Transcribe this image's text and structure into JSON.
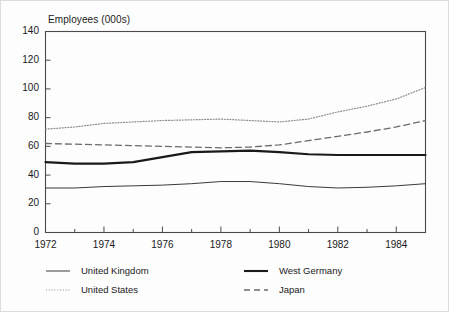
{
  "figure": {
    "title": "Employees (000s)",
    "background_color": "#fdfdfd",
    "border_color": "#dcdcdc"
  },
  "axes": {
    "y_label": "Employees (000s)",
    "y_ticks": [
      "0",
      "20",
      "40",
      "60",
      "80",
      "100",
      "120",
      "140"
    ],
    "x_ticks": [
      "1972",
      "1974",
      "1976",
      "1978",
      "1980",
      "1982",
      "1984"
    ],
    "x_minor_every_year": true
  },
  "legend": {
    "position": "below-plot",
    "entries": [
      {
        "label": "United Kingdom",
        "style": "thin-solid",
        "color": "#3a3a3a"
      },
      {
        "label": "West Germany",
        "style": "thick-solid",
        "color": "#1a1a1a"
      },
      {
        "label": "United States",
        "style": "dotted",
        "color": "#8a8a8a"
      },
      {
        "label": "Japan",
        "style": "dashed",
        "color": "#6a6a6a"
      }
    ]
  },
  "chart_data": {
    "type": "line",
    "title": "Employees (000s)",
    "xlabel": "",
    "ylabel": "Employees (000s)",
    "xlim": [
      1972,
      1985
    ],
    "ylim": [
      0,
      140
    ],
    "grid": false,
    "legend_position": "below",
    "x": [
      1972,
      1973,
      1974,
      1975,
      1976,
      1977,
      1978,
      1979,
      1980,
      1981,
      1982,
      1983,
      1984,
      1985
    ],
    "series": [
      {
        "name": "United Kingdom",
        "style": "thin-solid",
        "color": "#3a3a3a",
        "values": [
          31,
          31,
          32,
          32.5,
          33,
          34,
          35.5,
          35.5,
          34,
          32,
          31,
          31.5,
          32.5,
          34
        ]
      },
      {
        "name": "United States",
        "style": "dotted",
        "color": "#8a8a8a",
        "values": [
          72,
          73.5,
          76,
          77,
          78,
          78.5,
          79,
          78,
          77,
          79,
          84,
          88,
          93,
          101
        ]
      },
      {
        "name": "West Germany",
        "style": "thick-solid",
        "color": "#1a1a1a",
        "values": [
          49,
          48,
          48,
          49,
          52.5,
          56,
          56.5,
          57,
          56,
          54.5,
          54,
          54,
          54,
          54
        ]
      },
      {
        "name": "Japan",
        "style": "dashed",
        "color": "#6a6a6a",
        "values": [
          62,
          61.5,
          61,
          60.5,
          60,
          59.5,
          59,
          59.5,
          61,
          64,
          67,
          70,
          73.5,
          78
        ]
      }
    ]
  }
}
